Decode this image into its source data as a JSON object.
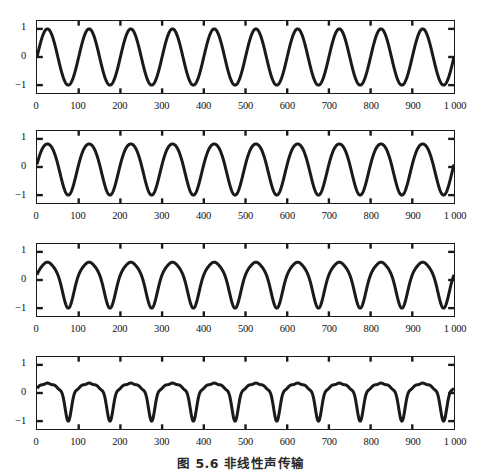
{
  "figure": {
    "caption": "图 5.6  非线性声传输",
    "panel_count": 4,
    "line_color": "#1a1a1a",
    "frame_color": "#1a1a1a",
    "background_color": "#ffffff"
  },
  "axes": {
    "x_ticks": [
      0,
      100,
      200,
      300,
      400,
      500,
      600,
      700,
      800,
      900,
      1000
    ],
    "x_tick_labels": [
      "0",
      "100",
      "200",
      "300",
      "400",
      "500",
      "600",
      "700",
      "800",
      "900",
      "1 000"
    ],
    "y_ticks": [
      1,
      0,
      -1
    ],
    "y_tick_labels": [
      "1",
      "0",
      "−1"
    ],
    "xlim": [
      0,
      1000
    ],
    "ylim": [
      -1.28,
      1.28
    ],
    "xlabel": "",
    "ylabel": "",
    "grid": false
  },
  "chart_data": [
    {
      "type": "line",
      "title": "",
      "panel_index": 1,
      "panel_label": "panel-1-source-waveform",
      "xlabel": "",
      "ylabel": "",
      "xlim": [
        0,
        1000
      ],
      "ylim": [
        -1.28,
        1.28
      ],
      "x_ticks": [
        0,
        100,
        200,
        300,
        400,
        500,
        600,
        700,
        800,
        900,
        1000
      ],
      "y_ticks": [
        1,
        0,
        -1
      ],
      "grid": false,
      "waveform": "sine",
      "period": 100,
      "cycles": 10,
      "amplitude": 1.0,
      "phase_deg": 0,
      "distortion": 0.0,
      "series": [
        {
          "name": "p(t) harmonic source",
          "description": "pure sinusoid, 10 cycles over 0-1000",
          "harmonics": [
            {
              "n": 1,
              "amp": 1.0,
              "phase_deg": 0
            }
          ]
        }
      ]
    },
    {
      "type": "line",
      "title": "",
      "panel_index": 2,
      "panel_label": "panel-2-early-distortion",
      "xlabel": "",
      "ylabel": "",
      "xlim": [
        0,
        1000
      ],
      "ylim": [
        -1.28,
        1.28
      ],
      "x_ticks": [
        0,
        100,
        200,
        300,
        400,
        500,
        600,
        700,
        800,
        900,
        1000
      ],
      "y_ticks": [
        1,
        0,
        -1
      ],
      "grid": false,
      "waveform": "slightly-distorted-sine",
      "period": 100,
      "cycles": 10,
      "amplitude": 1.0,
      "phase_deg": 0,
      "distortion": 0.12,
      "series": [
        {
          "name": "p(t) after short propagation",
          "description": "sinusoid with weak second-harmonic generation, leading edge steepening",
          "harmonics": [
            {
              "n": 1,
              "amp": 1.0,
              "phase_deg": 0
            },
            {
              "n": 2,
              "amp": 0.1,
              "phase_deg": 90
            }
          ]
        }
      ]
    },
    {
      "type": "line",
      "title": "",
      "panel_index": 3,
      "panel_label": "panel-3-moderate-distortion",
      "xlabel": "",
      "ylabel": "",
      "xlim": [
        0,
        1000
      ],
      "ylim": [
        -1.28,
        1.28
      ],
      "x_ticks": [
        0,
        100,
        200,
        300,
        400,
        500,
        600,
        700,
        800,
        900,
        1000
      ],
      "y_ticks": [
        1,
        0,
        -1
      ],
      "grid": false,
      "waveform": "asymmetric-sawtooth-forming",
      "period": 100,
      "cycles": 10,
      "amplitude": 1.0,
      "phase_deg": 0,
      "distortion": 0.3,
      "series": [
        {
          "name": "p(t) approaching shock",
          "description": "markedly asymmetric: slower rise, steeper fall, shock front forming",
          "harmonics": [
            {
              "n": 1,
              "amp": 1.0,
              "phase_deg": 0
            },
            {
              "n": 2,
              "amp": 0.24,
              "phase_deg": 90
            },
            {
              "n": 3,
              "amp": 0.07,
              "phase_deg": 180
            }
          ]
        }
      ]
    },
    {
      "type": "line",
      "title": "",
      "panel_index": 4,
      "panel_label": "panel-4-sawtooth-shock",
      "xlabel": "",
      "ylabel": "",
      "xlim": [
        0,
        1000
      ],
      "ylim": [
        -1.28,
        1.28
      ],
      "x_ticks": [
        0,
        100,
        200,
        300,
        400,
        500,
        600,
        700,
        800,
        900,
        1000
      ],
      "y_ticks": [
        1,
        0,
        -1
      ],
      "grid": false,
      "waveform": "sawtooth-with-shoulder",
      "period": 100,
      "cycles": 10,
      "amplitude": 1.0,
      "phase_deg": 0,
      "distortion": 0.75,
      "series": [
        {
          "name": "p(t) fully developed sawtooth",
          "description": "strongly nonlinear: sharp peak, abrupt drop to -1, slow recovery with mid-cycle shoulder",
          "harmonics": [
            {
              "n": 1,
              "amp": 1.0,
              "phase_deg": 0
            },
            {
              "n": 2,
              "amp": 0.5,
              "phase_deg": 90
            },
            {
              "n": 3,
              "amp": 0.3,
              "phase_deg": 180
            },
            {
              "n": 4,
              "amp": 0.16,
              "phase_deg": 270
            },
            {
              "n": 5,
              "amp": 0.08,
              "phase_deg": 0
            }
          ]
        }
      ]
    }
  ]
}
